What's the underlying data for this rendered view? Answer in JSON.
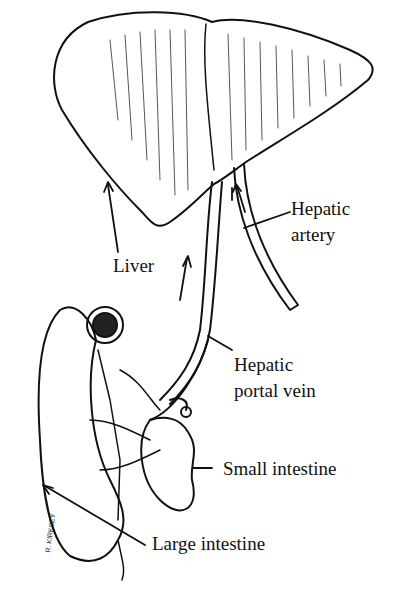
{
  "diagram": {
    "labels": {
      "liver": "Liver",
      "hepatic_artery_1": "Hepatic",
      "hepatic_artery_2": "artery",
      "hepatic_portal_vein_1": "Hepatic",
      "hepatic_portal_vein_2": "portal vein",
      "small_intestine": "Small intestine",
      "large_intestine": "Large intestine"
    },
    "signature": "R. KIRKSEY"
  }
}
